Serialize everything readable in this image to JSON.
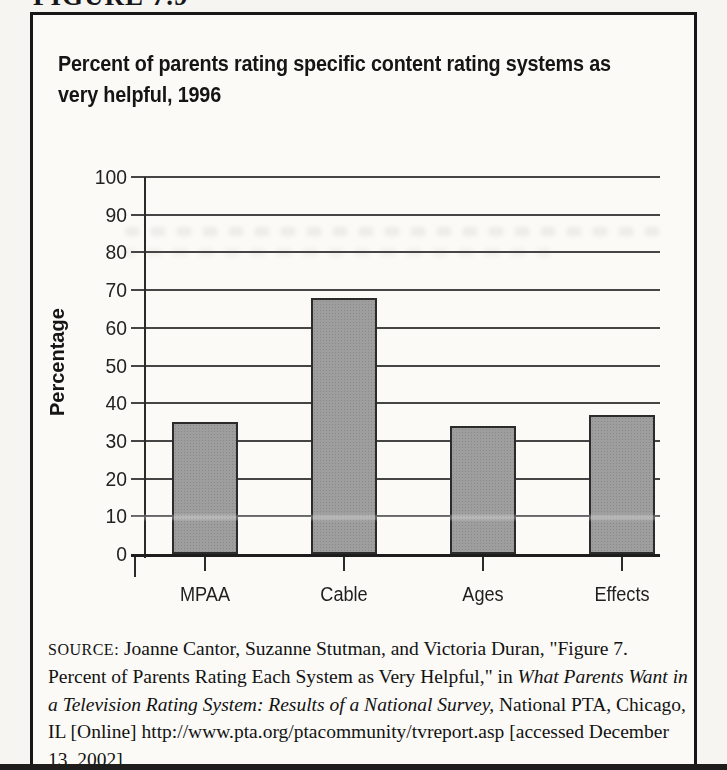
{
  "figure_label": "FIGURE 7.9",
  "chart_data": {
    "type": "bar",
    "title": "Percent of parents rating specific content rating systems as very helpful, 1996",
    "title_lines": [
      "Percent of parents rating specific content rating systems as",
      "very helpful, 1996"
    ],
    "categories": [
      "MPAA",
      "Cable",
      "Ages",
      "Effects"
    ],
    "values": [
      35,
      68,
      34,
      37
    ],
    "xlabel": "",
    "ylabel": "Percentage",
    "ylim": [
      0,
      100
    ],
    "yticks": [
      0,
      10,
      20,
      30,
      40,
      50,
      60,
      70,
      80,
      90,
      100
    ],
    "grid": "horizontal",
    "legend": "none",
    "bar_fill": "#9e9e9e",
    "bar_border": "#2b2b2b"
  },
  "source": {
    "label": "SOURCE:",
    "segments": [
      {
        "style": "normal",
        "text": " Joanne Cantor, Suzanne Stutman, and Victoria Duran, \"Figure 7. Percent of Parents Rating Each System as Very Helpful,\" in "
      },
      {
        "style": "italic",
        "text": "What Parents Want in a Television Rating System: Results of a National Survey,"
      },
      {
        "style": "normal",
        "text": " National PTA, Chicago, IL [Online] http://www.pta.org/ptacommunity/tvreport.asp [accessed December 13, 2002]"
      }
    ]
  },
  "colors": {
    "page_background": "#f6f5f2",
    "box_background": "#fbfaf7",
    "box_border": "#171717",
    "gridline": "#454545",
    "text": "#1c1c1c"
  }
}
